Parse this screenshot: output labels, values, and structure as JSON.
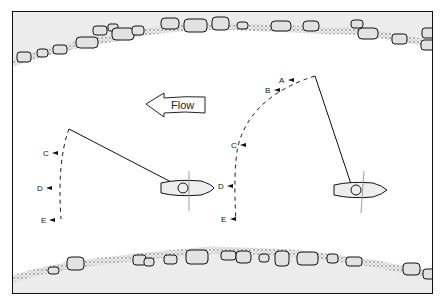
{
  "figure": {
    "flow_label": "Flow",
    "left_scenario": {
      "labels": [
        "C",
        "D",
        "E"
      ]
    },
    "right_scenario": {
      "labels": [
        "A",
        "B",
        "C",
        "D",
        "E"
      ]
    },
    "caption_partial": "Figure ... (caption cut off)"
  },
  "colors": {
    "line": "#111111",
    "bank_fill": "#e9e9e9",
    "rock_fill": "#dddddd"
  }
}
